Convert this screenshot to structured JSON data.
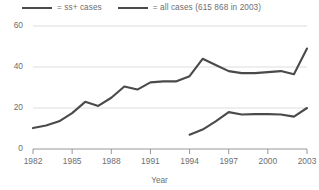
{
  "chart_data": {
    "type": "line",
    "title": "",
    "xlabel": "Year",
    "ylabel": "",
    "xlim": [
      1982,
      2003
    ],
    "ylim": [
      0,
      60
    ],
    "yticks": [
      0,
      20,
      40,
      60
    ],
    "xticks": [
      1982,
      1985,
      1988,
      1991,
      1994,
      1997,
      2000,
      2003
    ],
    "grid": "horizontal",
    "legend_position": "top",
    "x": [
      1982,
      1983,
      1984,
      1985,
      1986,
      1987,
      1988,
      1989,
      1990,
      1991,
      1992,
      1993,
      1994,
      1995,
      1996,
      1997,
      1998,
      1999,
      2000,
      2001,
      2002,
      2003
    ],
    "series": [
      {
        "name": "all cases (615 868 in 2003)",
        "color": "#4a4a4a",
        "x": [
          1982,
          1983,
          1984,
          1985,
          1986,
          1987,
          1988,
          1989,
          1990,
          1991,
          1992,
          1993,
          1994,
          1995,
          1996,
          1997,
          1998,
          1999,
          2000,
          2001,
          2002,
          2003
        ],
        "values": [
          10.2,
          11.5,
          13.5,
          17.5,
          23.0,
          21.0,
          25.0,
          30.5,
          29.0,
          32.5,
          33.0,
          33.0,
          35.5,
          44.0,
          41.0,
          38.0,
          37.0,
          37.0,
          37.5,
          38.0,
          36.5,
          49.0
        ]
      },
      {
        "name": "ss+ cases",
        "color": "#4a4a4a",
        "x": [
          1994,
          1995,
          1996,
          1997,
          1998,
          1999,
          2000,
          2001,
          2002,
          2003
        ],
        "values": [
          7.0,
          9.5,
          13.5,
          18.0,
          16.8,
          17.0,
          17.0,
          16.8,
          15.8,
          20.0
        ]
      }
    ],
    "legend": [
      {
        "label": "= ss+ cases",
        "color": "#4a4a4a"
      },
      {
        "label": "= all cases (615 868 in 2003)",
        "color": "#4a4a4a"
      }
    ],
    "ytick_labels": [
      "60",
      "40",
      "20",
      "0"
    ],
    "xtick_labels": [
      "1982",
      "1985",
      "1988",
      "1991",
      "1994",
      "1997",
      "2000",
      "2003"
    ]
  },
  "colors": {
    "line": "#4a4a4a",
    "grid": "#d9d9d9",
    "axis": "#8c8c8c",
    "text": "#6d6e71",
    "background": "#ffffff"
  }
}
